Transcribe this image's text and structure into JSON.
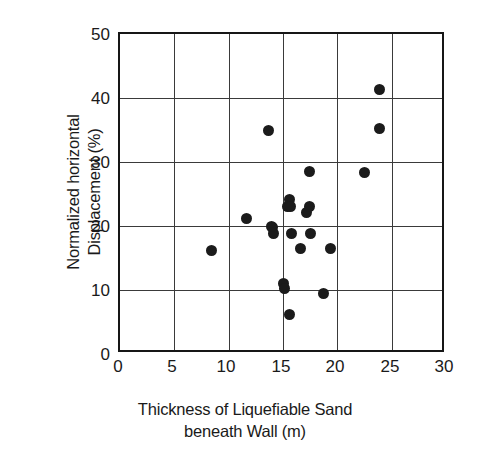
{
  "chart_data": {
    "type": "scatter",
    "title": "",
    "xlabel": "Thickness of Liquefiable Sand beneath Wall (m)",
    "xlabel_lines": [
      "Thickness of Liquefiable Sand",
      "beneath Wall (m)"
    ],
    "ylabel": "Normalized horizontal Displacement (%)",
    "ylabel_lines": [
      "Normalized horizontal",
      "Displacement (%)"
    ],
    "xlim": [
      0,
      30
    ],
    "ylim": [
      0,
      50
    ],
    "xticks": [
      0,
      5,
      10,
      15,
      20,
      25,
      30
    ],
    "xticklabels": [
      "0",
      "5",
      "10",
      "15",
      "20",
      "25",
      "30"
    ],
    "yticks": [
      0,
      10,
      20,
      30,
      40,
      50
    ],
    "yticklabels": [
      "0",
      "10",
      "20",
      "30",
      "40",
      "50"
    ],
    "grid": true,
    "gridlines_x": [
      5,
      10,
      15,
      20,
      25
    ],
    "gridlines_y": [
      10,
      20,
      30,
      40
    ],
    "legend": null,
    "marker": "filled-circle",
    "marker_color": "#1b1b1b",
    "marker_size_px": 11,
    "n_points": 23,
    "points": [
      {
        "x": 8.4,
        "y": 16.1
      },
      {
        "x": 11.6,
        "y": 21.1
      },
      {
        "x": 13.7,
        "y": 35.0
      },
      {
        "x": 14.0,
        "y": 19.8
      },
      {
        "x": 14.1,
        "y": 18.8
      },
      {
        "x": 15.0,
        "y": 11.0
      },
      {
        "x": 15.1,
        "y": 10.3
      },
      {
        "x": 15.6,
        "y": 6.2
      },
      {
        "x": 15.4,
        "y": 23.0
      },
      {
        "x": 15.6,
        "y": 24.2
      },
      {
        "x": 15.7,
        "y": 23.1
      },
      {
        "x": 15.8,
        "y": 18.9
      },
      {
        "x": 16.6,
        "y": 16.5
      },
      {
        "x": 17.2,
        "y": 22.1
      },
      {
        "x": 17.4,
        "y": 23.0
      },
      {
        "x": 17.4,
        "y": 28.5
      },
      {
        "x": 17.5,
        "y": 18.9
      },
      {
        "x": 18.7,
        "y": 9.4
      },
      {
        "x": 19.4,
        "y": 16.5
      },
      {
        "x": 22.5,
        "y": 28.4
      },
      {
        "x": 23.9,
        "y": 41.4
      },
      {
        "x": 23.9,
        "y": 35.3
      },
      {
        "x": 13.9,
        "y": 19.9
      }
    ]
  },
  "axes": {
    "frame_color": "#161616",
    "grid_color": "#3a3a3a"
  }
}
